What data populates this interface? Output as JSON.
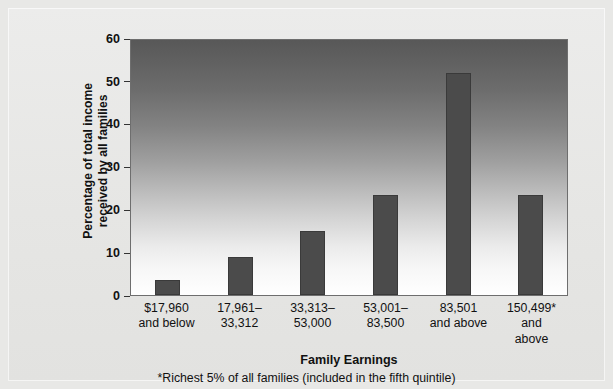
{
  "chart_data": {
    "type": "bar",
    "title": "",
    "xlabel": "Family Earnings",
    "ylabel": "Percentage of total income\nreceived by all families",
    "ylabel_line1": "Percentage of total income",
    "ylabel_line2": "received by all families",
    "categories": [
      "$17,960\nand below",
      "17,961–\n33,312",
      "33,313–\n53,000",
      "53,001–\n83,500",
      "83,501\nand above",
      "150,499*\nand\nabove"
    ],
    "values": [
      3.6,
      8.8,
      15.0,
      23.4,
      51.8,
      23.4
    ],
    "ylim": [
      0,
      60
    ],
    "yticks": [
      0,
      10,
      20,
      30,
      40,
      50,
      60
    ],
    "ytick_labels": [
      "0",
      "10",
      "20",
      "30",
      "40",
      "50",
      "60"
    ],
    "grid": false,
    "legend": "none",
    "footnote": "*Richest 5% of all families (included in the fifth quintile)",
    "bar_color": "#4b4b4b",
    "plot_background_gradient_top": "#585858",
    "plot_background_gradient_bottom": "#ffffff",
    "figure_background": "#e8e8e6"
  }
}
